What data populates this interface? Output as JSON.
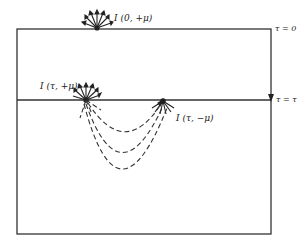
{
  "diagram": {
    "labels": {
      "top_intensity": "I (0, +μ)",
      "upward_intensity": "I (τ, +μ)",
      "downward_intensity": "I (τ, −μ)",
      "surface_depth": "τ = 0",
      "layer_depth": "τ = τ"
    },
    "elements": {
      "slab_boundary": "rectangle",
      "surface_line": "τ = 0 boundary",
      "depth_line": "τ = τ level",
      "emitting_bursts": 3,
      "scattering_arcs": 3
    },
    "colors": {
      "stroke": "#333333",
      "background": "#ffffff"
    }
  }
}
